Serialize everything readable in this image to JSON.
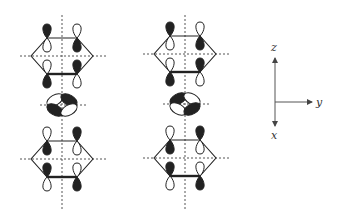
{
  "colors": {
    "ink": "#222222",
    "dash": "#555555",
    "fill_dark": "#222222",
    "fill_light": "#ffffff"
  },
  "axes": {
    "origin": [
      275,
      102
    ],
    "z_label": "z",
    "y_label": "y",
    "x_label": "x"
  },
  "columns": [
    {
      "id": "left",
      "axis_x": 62,
      "vline": [
        15,
        210
      ],
      "top_ring": {
        "cy": 56,
        "top_phases": [
          "dark-up",
          "dark-down"
        ],
        "bottom_phases": [
          "dark-down",
          "dark-up"
        ]
      },
      "d_orbital": {
        "cy": 105,
        "lobes": {
          "ul": "light",
          "ur": "dark",
          "ll": "dark",
          "lr": "light"
        }
      },
      "bottom_ring": {
        "cy": 159,
        "top_phases": [
          "dark-down",
          "dark-up"
        ],
        "bottom_phases": [
          "dark-up",
          "dark-down"
        ]
      }
    },
    {
      "id": "right",
      "axis_x": 185,
      "vline": [
        15,
        210
      ],
      "top_ring": {
        "cy": 54,
        "top_phases": [
          "dark-up",
          "dark-down"
        ],
        "bottom_phases": [
          "dark-down",
          "dark-up"
        ]
      },
      "d_orbital": {
        "cy": 104,
        "lobes": {
          "ul": "dark",
          "ur": "light",
          "ll": "light",
          "lr": "dark"
        }
      },
      "bottom_ring": {
        "cy": 158,
        "top_phases": [
          "dark-down",
          "dark-up"
        ],
        "bottom_phases": [
          "dark-up",
          "dark-down"
        ]
      }
    }
  ]
}
